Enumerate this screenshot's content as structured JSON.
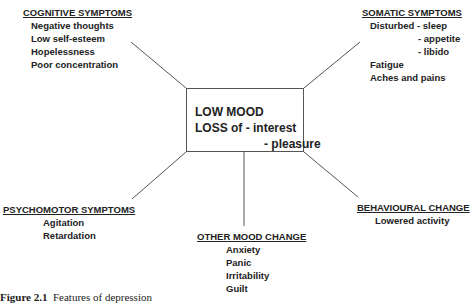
{
  "center": {
    "line1": "LOW MOOD",
    "line2": "LOSS of - interest",
    "line3": "- pleasure"
  },
  "cognitive": {
    "heading": "COGNITIVE SYMPTOMS",
    "items": [
      "Negative thoughts",
      "Low self-esteem",
      "Hopelessness",
      "Poor concentration"
    ]
  },
  "somatic": {
    "heading": "SOMATIC SYMPTOMS",
    "items": [
      "Disturbed - sleep",
      "- appetite",
      "- libido",
      "Fatigue",
      "Aches and pains"
    ]
  },
  "psychomotor": {
    "heading": "PSYCHOMOTOR SYMPTOMS",
    "items": [
      "Agitation",
      "Retardation"
    ]
  },
  "other_mood": {
    "heading": "OTHER MOOD CHANGE",
    "items": [
      "Anxiety",
      "Panic",
      "Irritability",
      "Guilt"
    ]
  },
  "behavioural": {
    "heading": "BEHAVIOURAL CHANGE",
    "items": [
      "Lowered activity"
    ]
  },
  "caption": {
    "label": "Figure 2.1",
    "text": "Features of depression"
  }
}
